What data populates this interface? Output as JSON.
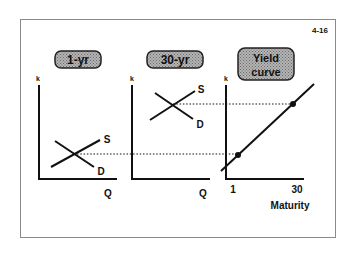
{
  "slide": {
    "number": "4-16"
  },
  "panels": [
    {
      "title": "1-yr",
      "y_axis_label": "k",
      "x_axis_label": "Q",
      "supply_label": "S",
      "demand_label": "D"
    },
    {
      "title": "30-yr",
      "y_axis_label": "k",
      "x_axis_label": "Q",
      "supply_label": "S",
      "demand_label": "D"
    },
    {
      "title_line1": "Yield",
      "title_line2": "curve",
      "y_axis_label": "k",
      "x_ticks": [
        "1",
        "30"
      ],
      "x_axis_label": "Maturity"
    }
  ],
  "colors": {
    "ink": "#111111",
    "label_box_fill": "#9a9a9a",
    "border": "#8a8a8a"
  }
}
